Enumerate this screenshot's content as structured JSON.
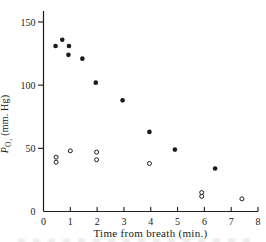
{
  "figure": {
    "background": "#ffffff",
    "ink": "#1a1a1a"
  },
  "chart_data": {
    "type": "scatter",
    "title": "",
    "xlabel": "Time from breath (min.)",
    "ylabel": "P_O2 (mm. Hg)",
    "ylabel_symbol": "P",
    "ylabel_subscript": "O₂",
    "ylabel_units": " (mm. Hg)",
    "xlim": [
      0,
      8
    ],
    "ylim": [
      0,
      150
    ],
    "x_ticks": [
      0,
      1,
      2,
      3,
      4,
      5,
      6,
      7,
      8
    ],
    "y_ticks": [
      0,
      50,
      100,
      150
    ],
    "grid": false,
    "legend_position": "none",
    "series": [
      {
        "name": "filled-circles",
        "marker": "filled-circle",
        "points": [
          [
            0.45,
            131
          ],
          [
            0.7,
            136
          ],
          [
            0.95,
            131
          ],
          [
            0.93,
            124
          ],
          [
            1.45,
            121
          ],
          [
            1.95,
            102
          ],
          [
            2.95,
            88
          ],
          [
            3.95,
            63
          ],
          [
            4.9,
            49
          ],
          [
            6.4,
            34
          ]
        ]
      },
      {
        "name": "open-circles",
        "marker": "open-circle",
        "points": [
          [
            0.47,
            43
          ],
          [
            0.47,
            39
          ],
          [
            1.0,
            48
          ],
          [
            1.98,
            47
          ],
          [
            1.98,
            41
          ],
          [
            3.95,
            38
          ],
          [
            5.9,
            15
          ],
          [
            5.9,
            12
          ],
          [
            7.4,
            10
          ]
        ]
      }
    ]
  }
}
